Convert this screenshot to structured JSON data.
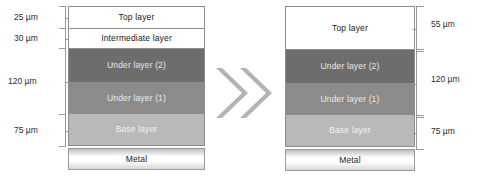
{
  "diagram": {
    "arrow_icon": "double-chevron-right-icon",
    "colors": {
      "top_layer": "#ffffff",
      "intermediate_layer": "#ffffff",
      "under_layer_2": "#6d6d6d",
      "under_layer_1": "#8b8b8b",
      "base_layer": "#b9b9b9",
      "metal": "#ffffff",
      "border": "#8d8d8d",
      "arrow": "#b3b3b3",
      "text_dark": "#1a1a1a",
      "text_light": "#ececec"
    },
    "left": {
      "name": "before-stack",
      "layers": [
        {
          "key": "top",
          "label": "Top layer",
          "dimension": "25 µm",
          "fill": "white"
        },
        {
          "key": "intermediate",
          "label": "Intermediate  layer",
          "dimension": "30 µm",
          "fill": "white"
        },
        {
          "key": "under2",
          "label": "Under layer (2)",
          "dimension": "",
          "fill": "dark"
        },
        {
          "key": "under1",
          "label": "Under layer (1)",
          "dimension": "",
          "fill": "mid"
        },
        {
          "key": "base",
          "label": "Base layer",
          "dimension": "75 µm",
          "fill": "light"
        },
        {
          "key": "metal",
          "label": "Metal",
          "dimension": "",
          "fill": "metal"
        }
      ],
      "dimensions": [
        {
          "key": "top",
          "value": "25 µm"
        },
        {
          "key": "inter",
          "value": "30 µm"
        },
        {
          "key": "under",
          "value": "120 µm"
        },
        {
          "key": "base",
          "value": "75 µm"
        }
      ]
    },
    "right": {
      "name": "after-stack",
      "layers": [
        {
          "key": "top",
          "label": "Top layer",
          "dimension": "55 µm",
          "fill": "white"
        },
        {
          "key": "under2",
          "label": "Under layer (2)",
          "dimension": "",
          "fill": "dark"
        },
        {
          "key": "under1",
          "label": "Under layer (1)",
          "dimension": "",
          "fill": "mid"
        },
        {
          "key": "base",
          "label": "Base layer",
          "dimension": "75 µm",
          "fill": "light"
        },
        {
          "key": "metal",
          "label": "Metal",
          "dimension": "",
          "fill": "metal"
        }
      ],
      "dimensions": [
        {
          "key": "top",
          "value": "55 µm"
        },
        {
          "key": "under",
          "value": "120 µm"
        },
        {
          "key": "base",
          "value": "75 µm"
        }
      ]
    }
  }
}
